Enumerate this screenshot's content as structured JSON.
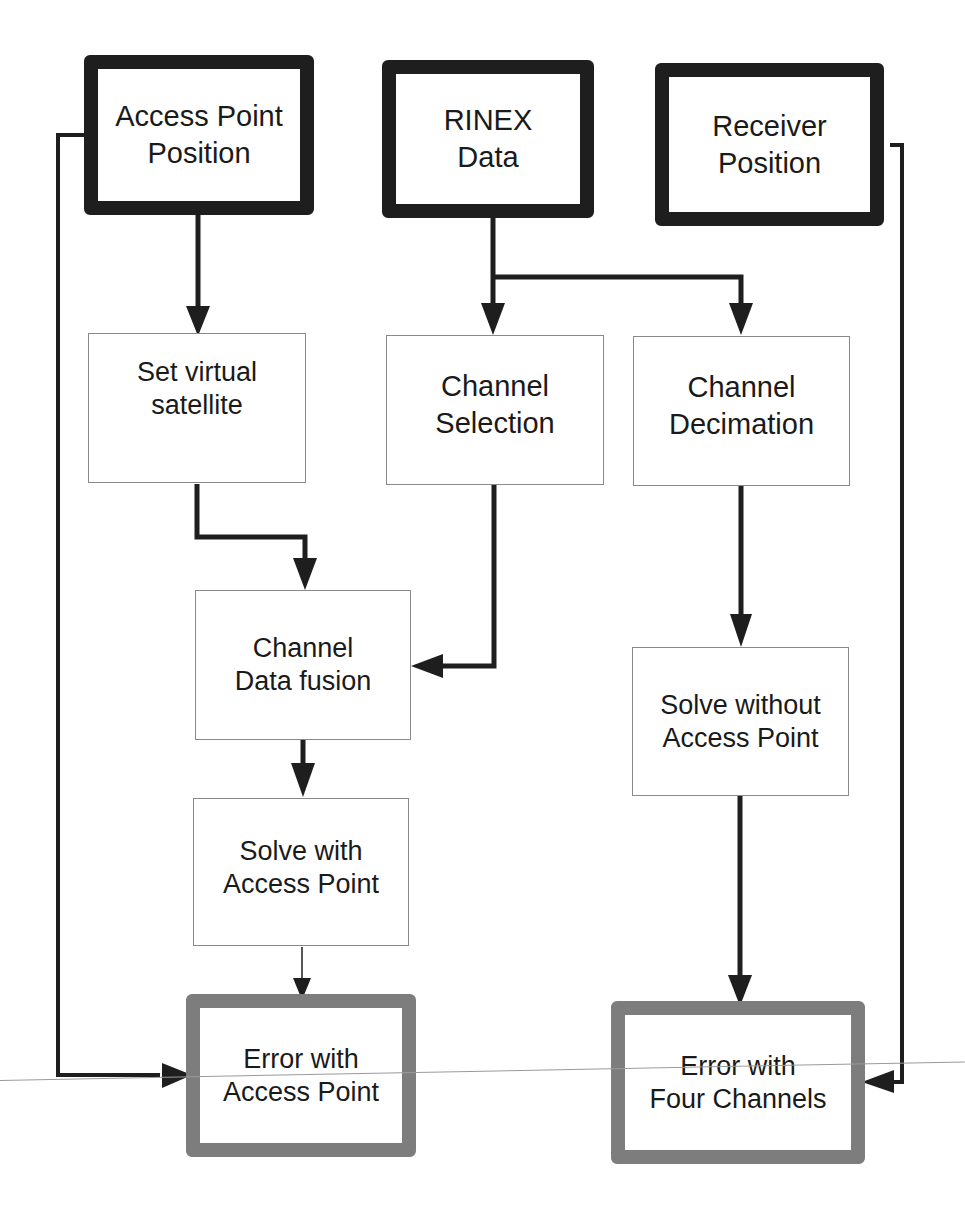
{
  "diagram": {
    "type": "flowchart",
    "colors": {
      "input_border": "#1e1e1e",
      "process_border": "#8a8a8a",
      "output_border": "#7d7d7d",
      "arrow": "#1e1e1e"
    },
    "nodes": [
      {
        "id": "ap_pos",
        "label": "Access Point\nPosition",
        "kind": "input"
      },
      {
        "id": "rinex",
        "label": "RINEX\nData",
        "kind": "input"
      },
      {
        "id": "rx_pos",
        "label": "Receiver\nPosition",
        "kind": "input"
      },
      {
        "id": "virt_sat",
        "label": "Set virtual\nsatellite",
        "kind": "process"
      },
      {
        "id": "ch_sel",
        "label": "Channel\nSelection",
        "kind": "process"
      },
      {
        "id": "ch_dec",
        "label": "Channel\nDecimation",
        "kind": "process"
      },
      {
        "id": "fusion",
        "label": "Channel\nData fusion",
        "kind": "process"
      },
      {
        "id": "solve_ap",
        "label": "Solve with\nAccess Point",
        "kind": "process"
      },
      {
        "id": "solve_noap",
        "label": "Solve without\nAccess Point",
        "kind": "process"
      },
      {
        "id": "err_ap",
        "label": "Error with\nAccess Point",
        "kind": "output"
      },
      {
        "id": "err_4ch",
        "label": "Error with\nFour Channels",
        "kind": "output"
      }
    ],
    "edges": [
      {
        "from": "ap_pos",
        "to": "virt_sat"
      },
      {
        "from": "ap_pos",
        "to": "err_ap"
      },
      {
        "from": "rinex",
        "to": "ch_sel"
      },
      {
        "from": "rinex",
        "to": "ch_dec"
      },
      {
        "from": "rx_pos",
        "to": "err_4ch"
      },
      {
        "from": "virt_sat",
        "to": "fusion"
      },
      {
        "from": "ch_sel",
        "to": "fusion"
      },
      {
        "from": "fusion",
        "to": "solve_ap"
      },
      {
        "from": "solve_ap",
        "to": "err_ap"
      },
      {
        "from": "ch_dec",
        "to": "solve_noap"
      },
      {
        "from": "solve_noap",
        "to": "err_4ch"
      }
    ]
  }
}
